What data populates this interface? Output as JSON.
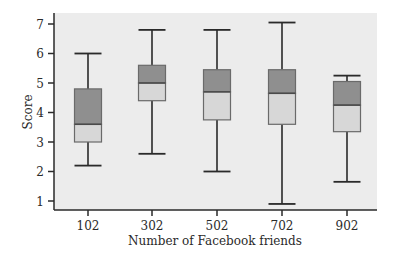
{
  "chart_data": {
    "type": "boxplot",
    "title": "",
    "xlabel": "Number of Facebook friends",
    "ylabel": "Score",
    "ylim": [
      0.75,
      7.35
    ],
    "yticks": [
      1,
      2,
      3,
      4,
      5,
      6,
      7
    ],
    "grid": false,
    "legend": null,
    "categories": [
      "102",
      "302",
      "502",
      "702",
      "902"
    ],
    "boxes": [
      {
        "category": "102",
        "whisker_low": 2.2,
        "q1": 3.0,
        "median": 3.6,
        "q3": 4.8,
        "whisker_high": 6.0
      },
      {
        "category": "302",
        "whisker_low": 2.6,
        "q1": 4.4,
        "median": 5.0,
        "q3": 5.6,
        "whisker_high": 6.8
      },
      {
        "category": "502",
        "whisker_low": 2.0,
        "q1": 3.75,
        "median": 4.7,
        "q3": 5.45,
        "whisker_high": 6.8
      },
      {
        "category": "702",
        "whisker_low": 0.9,
        "q1": 3.6,
        "median": 4.65,
        "q3": 5.45,
        "whisker_high": 7.05
      },
      {
        "category": "902",
        "whisker_low": 1.65,
        "q1": 3.35,
        "median": 4.25,
        "q3": 5.05,
        "whisker_high": 5.25
      }
    ]
  },
  "colors": {
    "plot_background": "#ececec",
    "upper_box_fill": "#8f8f8f",
    "lower_box_fill": "#d7d7d7",
    "box_border": "#6a6a6a",
    "whisker": "#2a2a2a",
    "axis": "#2a2a2a"
  }
}
